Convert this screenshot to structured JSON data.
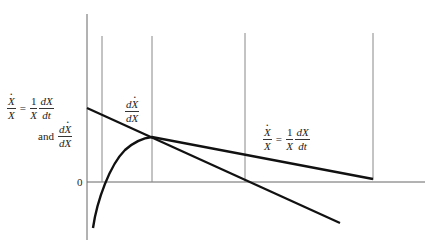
{
  "diagram": {
    "type": "economic-growth-rate-diagram",
    "axes": {
      "y_axis_label_line1": {
        "lhs_num": "X",
        "lhs_den": "X",
        "eq": "=",
        "coef_num": "1",
        "coef_den": "X",
        "rhs_num": "dX",
        "rhs_den": "dt"
      },
      "y_axis_label_line2": {
        "prefix": "and",
        "num": "dX",
        "den": "dX"
      },
      "origin_label": "0"
    },
    "curve_labels": {
      "marginal": {
        "num": "dX",
        "den": "dX"
      },
      "average": {
        "lhs_num": "X",
        "lhs_den": "X",
        "eq": "=",
        "coef_num": "1",
        "coef_den": "X",
        "rhs_num": "dX",
        "rhs_den": "dt"
      }
    },
    "colors": {
      "curve": "#111111",
      "axis": "#666666",
      "guide": "#888888",
      "background": "#ffffff"
    },
    "geometry": {
      "y_axis": {
        "x": 87,
        "y1": 14,
        "y2": 240
      },
      "x_axis": {
        "y": 182,
        "x1": 87,
        "x2": 425
      },
      "vertical_guides": [
        {
          "x": 102,
          "y1": 36,
          "y2": 182
        },
        {
          "x": 152,
          "y1": 36,
          "y2": 182
        },
        {
          "x": 245,
          "y1": 33,
          "y2": 182
        },
        {
          "x": 373,
          "y1": 33,
          "y2": 180
        }
      ],
      "marginal_line": {
        "x1": 87,
        "y1": 108,
        "x2": 340,
        "y2": 223
      },
      "average_curve": "M 93 228 C 97 200, 110 165, 125 150 C 135 141, 143 138, 152 137 L 373 179"
    }
  }
}
